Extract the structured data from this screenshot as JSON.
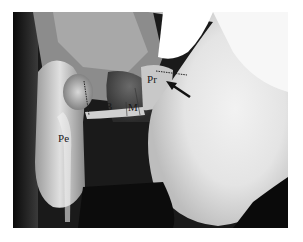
{
  "figure": {
    "type": "radiograph",
    "labels": {
      "pr": "Pr",
      "b": "B",
      "m": "M",
      "pe": "Pe"
    },
    "annotations": {
      "arrow": "arrow pointing to Pr",
      "dotted_lines": 2
    },
    "colors": {
      "frame_border": "#ffffff",
      "label_text": "#1a1a1a",
      "bright_region": "#f4f4f4",
      "dark_region": "#0c0c0c"
    }
  }
}
